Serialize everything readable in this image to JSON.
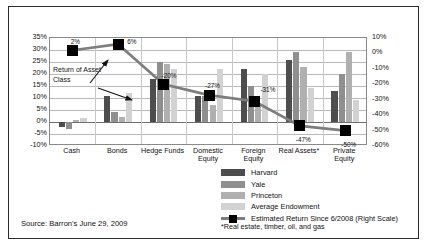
{
  "source": {
    "text": "Source: Barron's June 29, 2009"
  },
  "footnote": {
    "text": "*Real estate, timber, oil, and gas"
  },
  "annotation": {
    "line1": "Return of Asset",
    "line2": "Class"
  },
  "legend": {
    "items": [
      {
        "label": "Harvard",
        "color": "#4d4d4d",
        "type": "bar"
      },
      {
        "label": "Yale",
        "color": "#8f8f8f",
        "type": "bar"
      },
      {
        "label": "Princeton",
        "color": "#b0b0b0",
        "type": "bar"
      },
      {
        "label": "Average Endowment",
        "color": "#d2d2d2",
        "type": "bar"
      },
      {
        "label": "Estimated Return Since 6/2008 (Right Scale)",
        "color": "#000000",
        "type": "line"
      }
    ]
  },
  "chart_data": {
    "type": "bar",
    "title": "",
    "xlabel": "",
    "ylabel": "",
    "grid": true,
    "legend_position": "bottom-right",
    "categories": [
      "Cash",
      "Bonds",
      "Hedge Funds",
      "Domestic Equity",
      "Foreign Equity",
      "Real Assets*",
      "Private Equity"
    ],
    "left_axis": {
      "ticks": [
        "35%",
        "30%",
        "25%",
        "20%",
        "15%",
        "10%",
        "5%",
        "0%",
        "-5%",
        "-10%"
      ],
      "values": [
        35,
        30,
        25,
        20,
        15,
        10,
        5,
        0,
        -5,
        -10
      ],
      "ylim": [
        -10,
        35
      ],
      "step": 5
    },
    "right_axis": {
      "ticks": [
        "10%",
        "0%",
        "-10%",
        "-20%",
        "-30%",
        "-40%",
        "-50%",
        "-60%"
      ],
      "values": [
        10,
        0,
        -10,
        -20,
        -30,
        -40,
        -50,
        -60
      ],
      "ylim": [
        -60,
        10
      ],
      "step": 10
    },
    "series": [
      {
        "name": "Harvard",
        "color": "#4d4d4d",
        "axis": "left",
        "values": [
          -2,
          11,
          18,
          11,
          22,
          26,
          13
        ]
      },
      {
        "name": "Yale",
        "color": "#8f8f8f",
        "axis": "left",
        "values": [
          -3,
          4,
          25,
          11,
          15,
          29,
          20
        ]
      },
      {
        "name": "Princeton",
        "color": "#b0b0b0",
        "axis": "left",
        "values": [
          1,
          2,
          24,
          7,
          8,
          23,
          29
        ]
      },
      {
        "name": "Average Endowment",
        "color": "#d2d2d2",
        "axis": "left",
        "values": [
          1.5,
          12,
          22,
          22,
          20,
          14,
          9
        ]
      }
    ],
    "line_series": {
      "name": "Estimated Return Since 6/2008 (Right Scale)",
      "axis": "right",
      "color": "#000000",
      "line_color": "#7d7d7d",
      "values": [
        2,
        6,
        -20,
        -27,
        -31,
        -47,
        -50
      ],
      "labels": [
        "2%",
        "6%",
        "-20%",
        "-27%",
        "-31%",
        "-47%",
        "-50%"
      ]
    }
  }
}
